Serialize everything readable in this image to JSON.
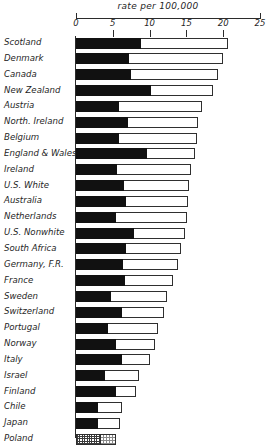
{
  "chart_data": {
    "type": "bar",
    "orientation": "horizontal",
    "title": "rate per 100,000",
    "xlabel": "rate per 100,000",
    "ylabel": "",
    "xlim": [
      0,
      25
    ],
    "xticks": [
      0,
      5,
      10,
      15,
      20,
      25
    ],
    "xtick_labels": [
      "0",
      "5",
      "10",
      "15",
      "20",
      "25"
    ],
    "grid": false,
    "legend": null,
    "categories": [
      "Scotland",
      "Denmark",
      "Canada",
      "New Zealand",
      "Austria",
      "North. Ireland",
      "Belgium",
      "England & Wales",
      "Ireland",
      "U.S. White",
      "Australia",
      "Netherlands",
      "U.S. Nonwhite",
      "South Africa",
      "Germany, F.R.",
      "France",
      "Sweden",
      "Switzerland",
      "Portugal",
      "Norway",
      "Italy",
      "Israel",
      "Finland",
      "Chile",
      "Japan",
      "Poland"
    ],
    "series": [
      {
        "name": "filled",
        "values": [
          8.8,
          7.2,
          7.5,
          10.2,
          5.9,
          7.1,
          5.9,
          9.6,
          5.6,
          6.5,
          6.8,
          5.4,
          7.9,
          6.8,
          6.4,
          6.7,
          4.8,
          6.3,
          4.4,
          5.4,
          6.2,
          3.9,
          5.5,
          3.0,
          3.0,
          3.4
        ]
      },
      {
        "name": "total",
        "values": [
          20.6,
          20.0,
          19.3,
          18.6,
          17.1,
          16.6,
          16.4,
          16.2,
          15.6,
          15.3,
          15.2,
          15.1,
          14.8,
          14.2,
          13.9,
          13.2,
          12.4,
          11.9,
          11.2,
          10.8,
          10.1,
          8.6,
          8.2,
          6.3,
          6.0,
          5.4
        ]
      }
    ],
    "textures": {
      "filled_default": "solid-black",
      "filled_poland": "stipple",
      "total_default": "white-outline",
      "total_poland": "stipple-light"
    }
  }
}
